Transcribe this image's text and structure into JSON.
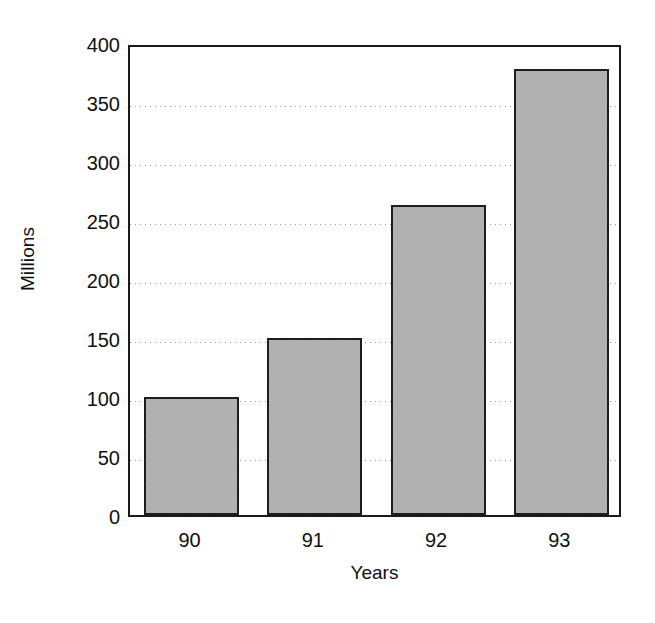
{
  "chart_data": {
    "type": "bar",
    "title": "",
    "subtitle": "",
    "categories": [
      "90",
      "91",
      "92",
      "93"
    ],
    "values": [
      100,
      150,
      263,
      378
    ],
    "series": [
      {
        "name": "Millions",
        "values": [
          100,
          150,
          263,
          378
        ]
      }
    ],
    "xlabel": "Years",
    "ylabel": "Millions",
    "ylim": [
      0,
      400
    ],
    "ytick_values": [
      0,
      50,
      100,
      150,
      200,
      250,
      300,
      350,
      400
    ],
    "ytick_labels": [
      "0",
      "50",
      "100",
      "150",
      "200",
      "250",
      "300",
      "350",
      "400"
    ],
    "xtick_labels": [
      "90",
      "91",
      "92",
      "93"
    ],
    "gridlines": {
      "axis": "y",
      "visible": true,
      "style": "dotted",
      "at": [
        50,
        100,
        150,
        200,
        250,
        300,
        350
      ]
    },
    "legend": {
      "visible": false,
      "position": "none",
      "entries": []
    },
    "annotations": [],
    "colors": {
      "bar_fill": "#a9a9a9",
      "bar_edge": "#1d1d1d",
      "axis": "#1a1a1a",
      "grid": "#9a9a9a",
      "text": "#111111",
      "background": "#ffffff"
    }
  }
}
